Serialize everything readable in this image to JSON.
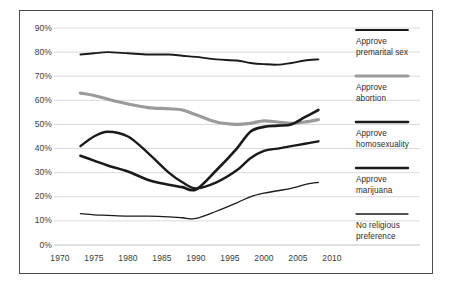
{
  "chart_data": {
    "type": "line",
    "title": "",
    "subtitle": "",
    "xlabel": "",
    "ylabel": "",
    "xlim": [
      1970,
      2010
    ],
    "ylim": [
      0,
      90
    ],
    "grid": true,
    "gridlines_y": [
      0,
      10,
      20,
      30,
      40,
      50,
      60,
      70,
      80,
      90
    ],
    "legend_position": "right",
    "x_ticks": [
      1970,
      1975,
      1980,
      1985,
      1990,
      1995,
      2000,
      2005,
      2010
    ],
    "x_tick_labels": [
      "1970",
      "1975",
      "1980",
      "1985",
      "1990",
      "1995",
      "2000",
      "2005",
      "2010"
    ],
    "y_ticks": [
      0,
      10,
      20,
      30,
      40,
      50,
      60,
      70,
      80,
      90
    ],
    "y_tick_labels": [
      "0%",
      "10%",
      "20%",
      "30%",
      "40%",
      "50%",
      "60%",
      "70%",
      "80%",
      "90%"
    ],
    "series": [
      {
        "name": "Approve premarital sex",
        "style": "dashed",
        "color": "#1a1a1a",
        "width": 1.9,
        "x": [
          1973,
          1975,
          1977,
          1980,
          1983,
          1986,
          1988,
          1990,
          1993,
          1996,
          1998,
          2000,
          2002,
          2004,
          2006,
          2008
        ],
        "values": [
          79,
          79.5,
          80,
          79.5,
          79,
          79,
          78.5,
          78,
          77,
          76.5,
          75.5,
          75,
          74.8,
          75.5,
          76.5,
          77
        ]
      },
      {
        "name": "Approve abortion",
        "style": "solid-gray",
        "color": "#9a9a9a",
        "width": 3.2,
        "x": [
          1973,
          1975,
          1977,
          1980,
          1983,
          1986,
          1988,
          1990,
          1993,
          1996,
          1998,
          2000,
          2002,
          2004,
          2006,
          2008
        ],
        "values": [
          63,
          62,
          60.5,
          58.5,
          57,
          56.5,
          56,
          54,
          51,
          50,
          50.5,
          51.5,
          51,
          50.5,
          51,
          52
        ]
      },
      {
        "name": "Approve homosexuality",
        "style": "solid-black",
        "color": "#1a1a1a",
        "width": 2.6,
        "x": [
          1973,
          1975,
          1977,
          1980,
          1983,
          1986,
          1988,
          1990,
          1993,
          1996,
          1998,
          2000,
          2002,
          2004,
          2006,
          2008
        ],
        "values": [
          37,
          35,
          33,
          30.5,
          27,
          25,
          24,
          23,
          31,
          40,
          47,
          49,
          49.5,
          50,
          53,
          56
        ]
      },
      {
        "name": "Approve marijuana",
        "style": "dotted",
        "color": "#1a1a1a",
        "width": 2.4,
        "x": [
          1973,
          1975,
          1977,
          1980,
          1983,
          1986,
          1988,
          1990,
          1993,
          1996,
          1998,
          2000,
          2002,
          2004,
          2006,
          2008
        ],
        "values": [
          41,
          45,
          47,
          45,
          38,
          30,
          26,
          23.5,
          26,
          31,
          36,
          39,
          40,
          41,
          42,
          43
        ]
      },
      {
        "name": "No religious preference",
        "style": "solid-thin",
        "color": "#1a1a1a",
        "width": 1.3,
        "x": [
          1973,
          1975,
          1977,
          1980,
          1983,
          1986,
          1988,
          1990,
          1993,
          1996,
          1998,
          2000,
          2002,
          2004,
          2006,
          2008
        ],
        "values": [
          13,
          12.5,
          12.3,
          12,
          12,
          11.7,
          11.3,
          11,
          14,
          17.5,
          20,
          21.5,
          22.5,
          23.5,
          25,
          26
        ]
      }
    ]
  },
  "legend": {
    "items": [
      {
        "label_line1": "Approve",
        "label_line2": "premarital sex",
        "swatch": "dashed-line-swatch"
      },
      {
        "label_line1": "Approve",
        "label_line2": "abortion",
        "swatch": "gray-line-swatch"
      },
      {
        "label_line1": "Approve",
        "label_line2": "homosexuality",
        "swatch": "black-line-swatch"
      },
      {
        "label_line1": "Approve",
        "label_line2": "marijuana",
        "swatch": "dotted-line-swatch"
      },
      {
        "label_line1": "No religious",
        "label_line2": "preference",
        "swatch": "thin-line-swatch"
      }
    ]
  }
}
